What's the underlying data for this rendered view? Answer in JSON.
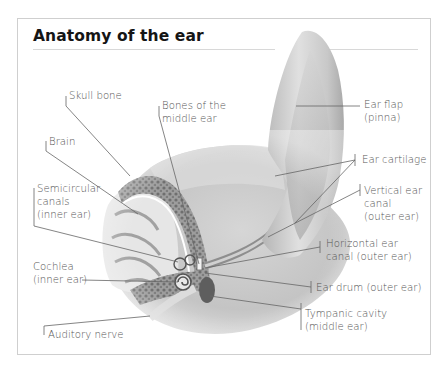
{
  "title": "Anatomy of the ear",
  "colors": {
    "frame_border": "#cfcfcf",
    "title": "#151515",
    "label_text": "#555555",
    "leader_line": "#666666"
  },
  "labels": {
    "skull_bone": {
      "line1": "Skull bone"
    },
    "bones_middle_ear": {
      "line1": "Bones of the",
      "line2": "middle ear"
    },
    "brain": {
      "line1": "Brain"
    },
    "semicircular_canals": {
      "line1": "Semicircular",
      "line2": "canals",
      "line3": "(inner ear)"
    },
    "cochlea": {
      "line1": "Cochlea",
      "line2": "(inner ear)"
    },
    "auditory_nerve": {
      "line1": "Auditory nerve"
    },
    "ear_flap": {
      "line1": "Ear flap",
      "line2": "(pinna)"
    },
    "ear_cartilage": {
      "line1": "Ear cartilage"
    },
    "vertical_ear_canal": {
      "line1": "Vertical ear",
      "line2": "canal",
      "line3": "(outer ear)"
    },
    "horizontal_ear_canal": {
      "line1": "Horizontal ear",
      "line2": "canal (outer ear)"
    },
    "ear_drum": {
      "line1": "Ear drum (outer ear)"
    },
    "tympanic_cavity": {
      "line1": "Tympanic cavity",
      "line2": "(middle ear)"
    }
  }
}
